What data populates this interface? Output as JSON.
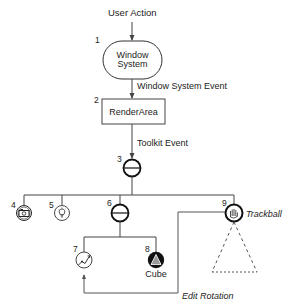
{
  "diagram": {
    "type": "scene-graph-event-flow",
    "top_label": "User Action",
    "nodes": [
      {
        "id": 1,
        "number": "1",
        "label_line1": "Window",
        "label_line2": "System",
        "shape": "rounded-pill"
      },
      {
        "id": 2,
        "number": "2",
        "label": "RenderArea",
        "shape": "rectangle"
      },
      {
        "id": 3,
        "number": "3",
        "shape": "group-node-circle"
      },
      {
        "id": 4,
        "number": "4",
        "shape": "camera-node",
        "icon": "camera-icon"
      },
      {
        "id": 5,
        "number": "5",
        "shape": "light-node",
        "icon": "lightbulb-icon"
      },
      {
        "id": 6,
        "number": "6",
        "shape": "group-node-circle"
      },
      {
        "id": 7,
        "number": "7",
        "shape": "rotation-node",
        "icon": "rotation-icon"
      },
      {
        "id": 8,
        "number": "8",
        "label": "Cube",
        "shape": "shape-node",
        "icon": "cube-shape-icon"
      },
      {
        "id": 9,
        "number": "9",
        "label": "Trackball",
        "shape": "manipulator-node",
        "icon": "hand-icon"
      }
    ],
    "edges": [
      {
        "from": "User Action",
        "to": 1,
        "label": ""
      },
      {
        "from": 1,
        "to": 2,
        "label": "Window System Event"
      },
      {
        "from": 2,
        "to": 3,
        "label": "Toolkit Event"
      },
      {
        "from": 3,
        "to": [
          4,
          5,
          6,
          9
        ],
        "label": ""
      },
      {
        "from": 6,
        "to": [
          7,
          8
        ],
        "label": ""
      },
      {
        "from": 9,
        "to": 7,
        "label": "Edit Rotation"
      }
    ],
    "labels": {
      "user_action": "User Action",
      "window_system_event": "Window System Event",
      "toolkit_event": "Toolkit Event",
      "edit_rotation": "Edit Rotation",
      "trackball": "Trackball",
      "cube": "Cube",
      "render_area": "RenderArea",
      "window": "Window",
      "system": "System"
    },
    "colors": {
      "line": "#555555",
      "stroke": "#111111",
      "cube_fill": "#111111",
      "cube_triangle": "#999999",
      "background": "#ffffff"
    }
  }
}
